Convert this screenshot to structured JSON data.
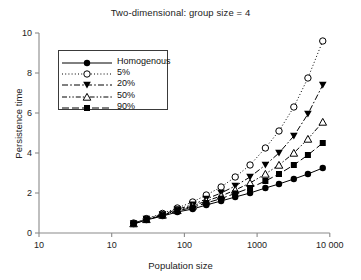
{
  "chart_data": {
    "type": "line",
    "title": "Two-dimensional: group size = 4",
    "xlabel": "Population size",
    "ylabel": "Persistence time",
    "xscale": "log",
    "yscale": "linear",
    "ylim": [
      0,
      10
    ],
    "yticks": [
      0,
      2,
      4,
      6,
      8,
      10
    ],
    "ytick_labels": [
      "0",
      "2",
      "4",
      "6",
      "8",
      "10"
    ],
    "xtick_labels": [
      "10",
      "10",
      "100",
      "1000",
      "10 000"
    ],
    "grid": false,
    "legend_position": "upper-left",
    "x": [
      20,
      30,
      50,
      80,
      130,
      200,
      320,
      500,
      800,
      1300,
      2000,
      3200,
      5000,
      8000
    ],
    "series": [
      {
        "name": "Homogenous",
        "marker": "filled-circle",
        "line_style": "solid",
        "values": [
          0.45,
          0.65,
          0.85,
          1.05,
          1.2,
          1.4,
          1.6,
          1.8,
          2.0,
          2.25,
          2.45,
          2.7,
          2.95,
          3.25
        ]
      },
      {
        "name": "5%",
        "marker": "open-circle",
        "line_style": "dotted",
        "values": [
          0.5,
          0.72,
          0.98,
          1.25,
          1.55,
          1.9,
          2.3,
          2.8,
          3.4,
          4.25,
          5.1,
          6.3,
          7.75,
          9.6
        ]
      },
      {
        "name": "20%",
        "marker": "filled-down-triangle",
        "line_style": "dash-dot",
        "values": [
          0.48,
          0.7,
          0.93,
          1.18,
          1.42,
          1.7,
          2.0,
          2.35,
          2.8,
          3.4,
          4.0,
          4.85,
          5.95,
          7.4
        ]
      },
      {
        "name": "50%",
        "marker": "open-up-triangle",
        "line_style": "dash-dot-dot",
        "values": [
          0.47,
          0.68,
          0.9,
          1.13,
          1.35,
          1.6,
          1.85,
          2.15,
          2.5,
          2.95,
          3.4,
          4.0,
          4.7,
          5.55
        ]
      },
      {
        "name": "90%",
        "marker": "filled-square",
        "line_style": "long-dash",
        "values": [
          0.46,
          0.66,
          0.88,
          1.1,
          1.28,
          1.5,
          1.72,
          1.98,
          2.25,
          2.6,
          2.95,
          3.4,
          3.9,
          4.5
        ]
      }
    ]
  },
  "legend": {
    "items": [
      {
        "label": "Homogenous"
      },
      {
        "label": "5%"
      },
      {
        "label": "20%"
      },
      {
        "label": "50%"
      },
      {
        "label": "90%"
      }
    ]
  },
  "axes": {
    "x_title": "Population size",
    "y_title": "Persistence time"
  }
}
